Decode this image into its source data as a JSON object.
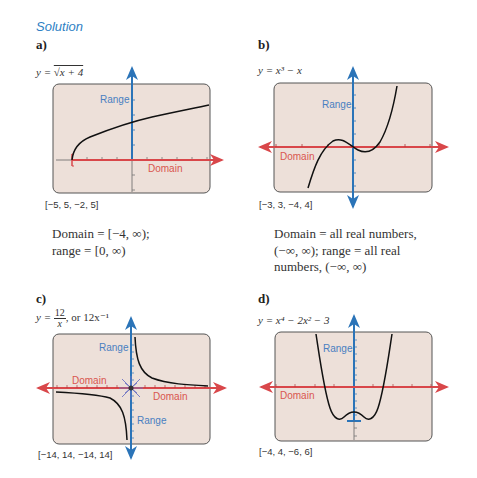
{
  "heading": "Solution",
  "panels": {
    "a": {
      "label": "a)",
      "equation_prefix": "y = ",
      "equation": "√x + 4",
      "window": "[−5, 5, −2, 5]",
      "range_label": "Range",
      "domain_label": "Domain",
      "description_line1": "Domain = [−4, ∞);",
      "description_line2": "range = [0, ∞)"
    },
    "b": {
      "label": "b)",
      "equation": "y = x³ − x",
      "window": "[−3, 3, −4, 4]",
      "range_label": "Range",
      "domain_label": "Domain",
      "description_line1": "Domain = all real numbers,",
      "description_line2": "(−∞, ∞); range = all real",
      "description_line3": "numbers, (−∞, ∞)"
    },
    "c": {
      "label": "c)",
      "equation_prefix": "y = ",
      "equation_num": "12",
      "equation_den": "x",
      "equation_suffix": ", or 12x⁻¹",
      "window": "[−14, 14, −14, 14]",
      "range_label_top": "Range",
      "range_label_bottom": "Range",
      "domain_label_left": "Domain",
      "domain_label_right": "Domain"
    },
    "d": {
      "label": "d)",
      "equation": "y = x⁴ − 2x² − 3",
      "window": "[−4, 4, −6, 6]",
      "range_label": "Range",
      "domain_label": "Domain"
    }
  },
  "colors": {
    "screen_fill": "#ede0d9",
    "screen_border": "#555555",
    "domain_axis": "#d9474a",
    "range_axis": "#2b74b8",
    "heading": "#2e7fc4"
  }
}
